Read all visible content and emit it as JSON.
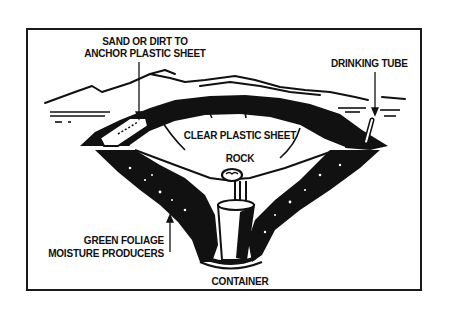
{
  "diagram": {
    "labels": {
      "anchor_line1": "SAND OR DIRT TO",
      "anchor_line2": "ANCHOR PLASTIC SHEET",
      "drinking_tube": "DRINKING TUBE",
      "clear_plastic": "CLEAR PLASTIC SHEET",
      "rock": "ROCK",
      "foliage_line1": "GREEN FOLIAGE",
      "foliage_line2": "MOISTURE PRODUCERS",
      "container": "CONTAINER"
    },
    "colors": {
      "ink": "#111111",
      "paper": "#ffffff"
    }
  }
}
